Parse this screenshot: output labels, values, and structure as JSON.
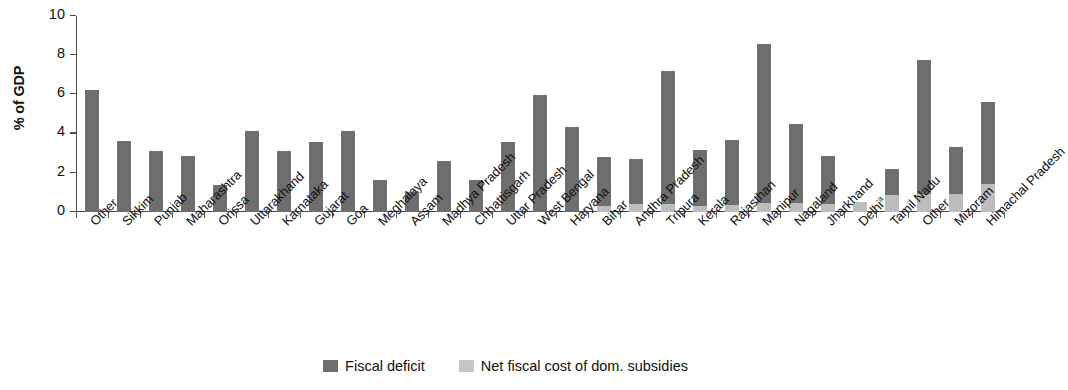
{
  "chart_data": {
    "type": "bar",
    "stacked": true,
    "title": "",
    "xlabel": "",
    "ylabel": "% of GDP",
    "ylim": [
      0,
      10
    ],
    "yticks": [
      0,
      2,
      4,
      6,
      8,
      10
    ],
    "grid": false,
    "legend_position": "bottom-center",
    "categories": [
      "Other",
      "Sikkim",
      "Punjab",
      "Maharashtra",
      "Orissa",
      "Uttarakhand",
      "Karnataka",
      "Gujarat",
      "Goa",
      "Meghalaya",
      "Assam",
      "Madhya Pradesh",
      "Chhattisgarh",
      "Uttar Pradesh",
      "West Bengal",
      "Haryana",
      "Bihar",
      "Andhra Pradesh",
      "Tripura",
      "Kerala",
      "Rajasthan",
      "Manipur",
      "Nagaland",
      "Jharkhand",
      "Delhi",
      "Tamil Nadu",
      "Other",
      "Mizoram",
      "Himachal Pradesh"
    ],
    "category_footnotes": {
      "24": "a"
    },
    "series": [
      {
        "name": "Fiscal deficit",
        "color": "#6e6e6e",
        "values": [
          6.2,
          3.6,
          3.1,
          2.85,
          1.4,
          4.15,
          3.1,
          3.55,
          4.15,
          1.65,
          1.0,
          2.6,
          1.65,
          3.55,
          5.95,
          4.35,
          2.5,
          2.3,
          6.8,
          2.85,
          3.3,
          8.1,
          4.05,
          2.45,
          0.0,
          1.35,
          6.85,
          2.4,
          4.15
        ]
      },
      {
        "name": "Net fiscal cost of dom. subsidies",
        "color": "#bdbdbd",
        "values": [
          0.0,
          0.0,
          0.0,
          0.0,
          0.0,
          0.0,
          0.0,
          0.0,
          0.0,
          0.0,
          0.0,
          0.0,
          0.0,
          0.0,
          0.0,
          0.0,
          0.3,
          0.4,
          0.4,
          0.3,
          0.35,
          0.45,
          0.45,
          0.4,
          0.5,
          0.85,
          0.9,
          0.9,
          1.45
        ]
      }
    ],
    "totals": [
      6.2,
      3.6,
      3.1,
      2.85,
      1.4,
      4.15,
      3.1,
      3.55,
      4.15,
      1.65,
      1.0,
      2.6,
      1.65,
      3.55,
      5.95,
      4.35,
      2.8,
      2.7,
      7.2,
      3.15,
      3.65,
      8.55,
      4.5,
      2.85,
      0.5,
      2.2,
      7.75,
      3.3,
      5.6
    ]
  },
  "legend": {
    "items": [
      {
        "label": "Fiscal deficit",
        "color": "#6e6e6e"
      },
      {
        "label": "Net fiscal cost of dom. subsidies",
        "color": "#c6c6c6"
      }
    ]
  }
}
